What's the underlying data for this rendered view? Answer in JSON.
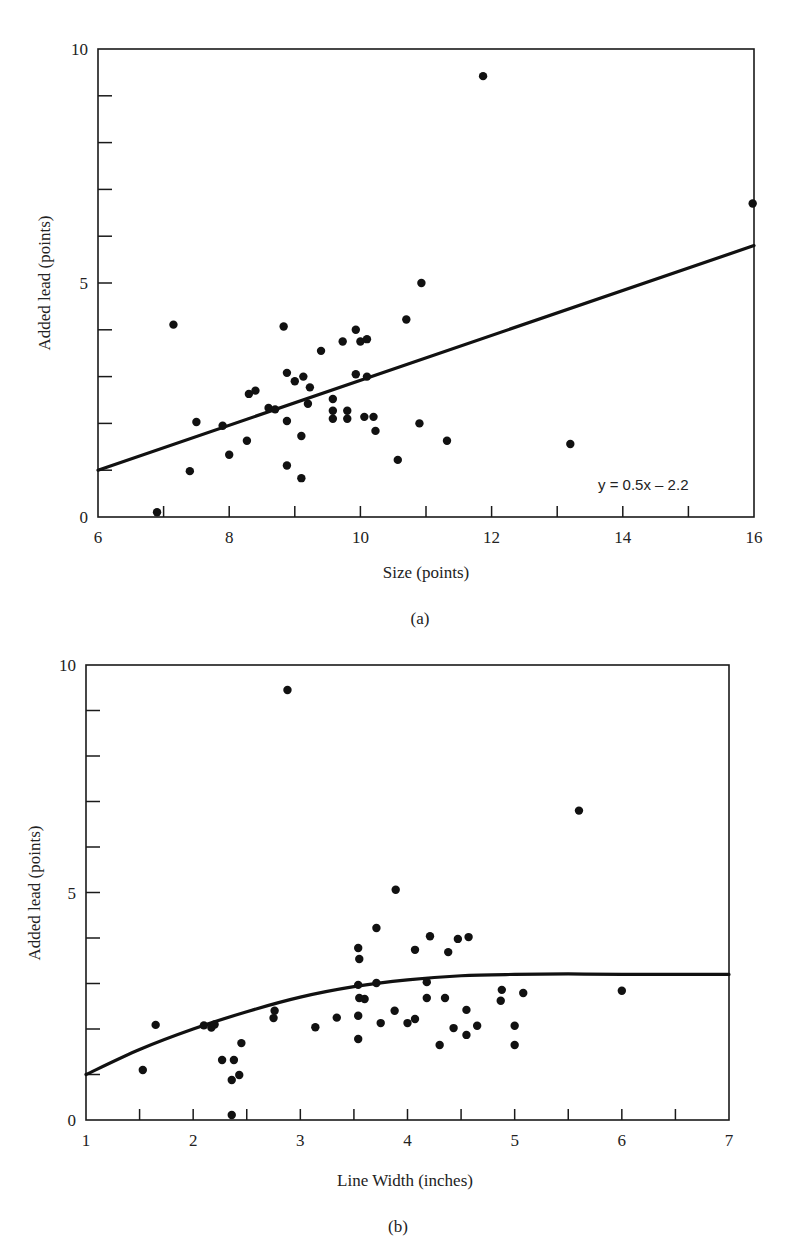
{
  "chart_data": [
    {
      "type": "scatter",
      "panel_label": "(a)",
      "title": "",
      "xlabel": "Size (points)",
      "ylabel": "Added lead (points)",
      "xlim": [
        6,
        16
      ],
      "ylim": [
        0,
        10
      ],
      "x_tick_labels": [
        "6",
        "8",
        "10",
        "12",
        "14",
        "16"
      ],
      "x_ticks_minor_step": 1,
      "y_tick_labels": [
        "0",
        "5",
        "10"
      ],
      "y_ticks_minor_step": 1,
      "grid": false,
      "fit": {
        "type": "linear",
        "equation_label": "y = 0.5x – 2.2",
        "from": [
          6,
          1.0
        ],
        "to": [
          16,
          5.8
        ]
      },
      "points": [
        [
          7.15,
          4.11
        ],
        [
          6.9,
          0.1
        ],
        [
          7.4,
          0.98
        ],
        [
          7.5,
          2.03
        ],
        [
          7.9,
          1.95
        ],
        [
          8.0,
          1.33
        ],
        [
          8.27,
          1.63
        ],
        [
          8.3,
          2.63
        ],
        [
          8.4,
          2.7
        ],
        [
          8.6,
          2.33
        ],
        [
          8.7,
          2.3
        ],
        [
          8.83,
          4.07
        ],
        [
          8.88,
          3.08
        ],
        [
          8.88,
          2.05
        ],
        [
          8.88,
          1.1
        ],
        [
          9.0,
          2.9
        ],
        [
          9.13,
          3.0
        ],
        [
          9.1,
          1.73
        ],
        [
          9.1,
          0.83
        ],
        [
          9.23,
          2.77
        ],
        [
          9.2,
          2.42
        ],
        [
          9.4,
          3.55
        ],
        [
          9.58,
          2.52
        ],
        [
          9.58,
          2.27
        ],
        [
          9.58,
          2.1
        ],
        [
          9.73,
          3.75
        ],
        [
          9.8,
          2.27
        ],
        [
          9.8,
          2.1
        ],
        [
          9.93,
          4.0
        ],
        [
          9.93,
          3.05
        ],
        [
          10.0,
          3.75
        ],
        [
          10.1,
          3.8
        ],
        [
          10.1,
          3.0
        ],
        [
          10.06,
          2.14
        ],
        [
          10.2,
          2.14
        ],
        [
          10.23,
          1.84
        ],
        [
          10.7,
          4.22
        ],
        [
          10.93,
          5.0
        ],
        [
          10.9,
          2.0
        ],
        [
          10.57,
          1.22
        ],
        [
          11.32,
          1.63
        ],
        [
          11.87,
          9.42
        ],
        [
          13.2,
          1.56
        ],
        [
          15.98,
          6.7
        ]
      ]
    },
    {
      "type": "scatter",
      "panel_label": "(b)",
      "title": "",
      "xlabel": "Line Width (inches)",
      "ylabel": "Added lead (points)",
      "xlim": [
        1,
        7
      ],
      "ylim": [
        0,
        10
      ],
      "x_tick_labels": [
        "1",
        "2",
        "3",
        "4",
        "5",
        "6",
        "7"
      ],
      "x_ticks_minor_step": 0.5,
      "y_tick_labels": [
        "0",
        "5",
        "10"
      ],
      "y_ticks_minor_step": 1,
      "grid": false,
      "fit": {
        "type": "curve",
        "points": [
          [
            1,
            1.0
          ],
          [
            1.5,
            1.55
          ],
          [
            2,
            2.0
          ],
          [
            2.5,
            2.38
          ],
          [
            3,
            2.7
          ],
          [
            3.5,
            2.93
          ],
          [
            4,
            3.08
          ],
          [
            4.5,
            3.17
          ],
          [
            5,
            3.2
          ],
          [
            5.5,
            3.21
          ],
          [
            6,
            3.2
          ],
          [
            7,
            3.2
          ]
        ]
      },
      "points": [
        [
          1.53,
          1.1
        ],
        [
          1.65,
          2.09
        ],
        [
          2.1,
          2.08
        ],
        [
          2.17,
          2.03
        ],
        [
          2.2,
          2.1
        ],
        [
          2.27,
          1.32
        ],
        [
          2.38,
          1.32
        ],
        [
          2.45,
          1.69
        ],
        [
          2.36,
          0.88
        ],
        [
          2.43,
          0.99
        ],
        [
          2.36,
          0.11
        ],
        [
          2.75,
          2.24
        ],
        [
          2.76,
          2.4
        ],
        [
          2.88,
          9.45
        ],
        [
          3.14,
          2.04
        ],
        [
          3.34,
          2.25
        ],
        [
          3.54,
          3.78
        ],
        [
          3.55,
          3.54
        ],
        [
          3.54,
          2.97
        ],
        [
          3.55,
          2.68
        ],
        [
          3.6,
          2.66
        ],
        [
          3.54,
          2.29
        ],
        [
          3.54,
          1.78
        ],
        [
          3.71,
          4.22
        ],
        [
          3.71,
          3.01
        ],
        [
          3.75,
          2.13
        ],
        [
          3.89,
          5.06
        ],
        [
          3.88,
          2.4
        ],
        [
          4.0,
          2.13
        ],
        [
          4.07,
          2.22
        ],
        [
          4.07,
          3.74
        ],
        [
          4.21,
          4.04
        ],
        [
          4.18,
          3.03
        ],
        [
          4.18,
          2.68
        ],
        [
          4.3,
          1.65
        ],
        [
          4.35,
          2.68
        ],
        [
          4.38,
          3.69
        ],
        [
          4.43,
          2.02
        ],
        [
          4.47,
          3.98
        ],
        [
          4.57,
          4.02
        ],
        [
          4.55,
          2.42
        ],
        [
          4.55,
          1.87
        ],
        [
          4.65,
          2.07
        ],
        [
          4.88,
          2.86
        ],
        [
          4.87,
          2.62
        ],
        [
          5.08,
          2.79
        ],
        [
          5.0,
          2.07
        ],
        [
          5.0,
          1.65
        ],
        [
          5.6,
          6.8
        ],
        [
          6.0,
          2.84
        ]
      ]
    }
  ]
}
